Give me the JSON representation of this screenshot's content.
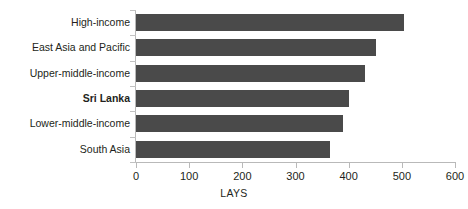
{
  "chart_data": {
    "type": "bar",
    "orientation": "horizontal",
    "title": "",
    "xlabel": "LAYS",
    "ylabel": "",
    "categories": [
      "High-income",
      "East Asia and Pacific",
      "Upper-middle-income",
      "Sri Lanka",
      "Lower-middle-income",
      "South Asia"
    ],
    "values": [
      505,
      452,
      430,
      400,
      390,
      365
    ],
    "highlight_category": "Sri Lanka",
    "xlim": [
      0,
      600
    ],
    "xticks": [
      0,
      100,
      200,
      300,
      400,
      500,
      600
    ],
    "xtick_labels": [
      "0",
      "100",
      "200",
      "300",
      "400",
      "500",
      "600"
    ],
    "grid": false,
    "legend": null,
    "bar_color": "#4a4a4a",
    "axis_color": "#b9b9b9",
    "text_color": "#231f20"
  }
}
